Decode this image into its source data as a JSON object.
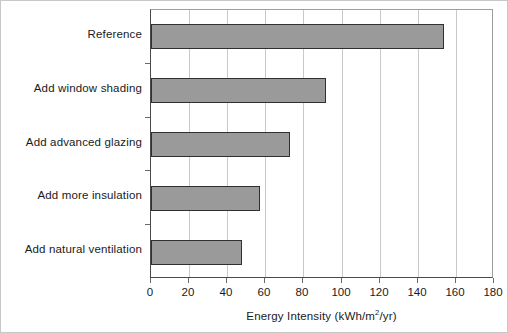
{
  "chart_data": {
    "type": "bar",
    "orientation": "horizontal",
    "title": "",
    "xlabel": "Energy Intensity (kWh/m²/yr)",
    "ylabel": "",
    "xlim": [
      0,
      180
    ],
    "xticks": [
      0,
      20,
      40,
      60,
      80,
      100,
      120,
      140,
      160,
      180
    ],
    "grid": true,
    "grid_axis": "x",
    "legend": false,
    "categories": [
      "Reference",
      "Add window shading",
      "Add advanced glazing",
      "Add more insulation",
      "Add natural ventilation"
    ],
    "values": [
      154,
      92,
      73,
      57,
      48
    ],
    "bars": [
      {
        "label": "Reference",
        "value": 154
      },
      {
        "label": "Add window shading",
        "value": 92
      },
      {
        "label": "Add advanced glazing",
        "value": 73
      },
      {
        "label": "Add more insulation",
        "value": 57
      },
      {
        "label": "Add natural ventilation",
        "value": 48
      }
    ],
    "colors": {
      "bar_fill": "#9a9a9a",
      "bar_edge": "#303030",
      "gridline": "#c9c9c9",
      "axis": "#4a4a4a",
      "text": "#1a1a1a",
      "background": "#ffffff"
    }
  },
  "axis_title_parts": {
    "before": "Energy Intensity (kWh/m",
    "superscript": "2",
    "after": "/yr)"
  }
}
